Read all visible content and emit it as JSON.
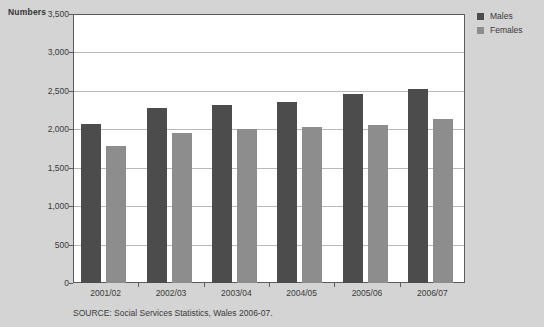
{
  "chart_data": {
    "type": "bar",
    "title": "",
    "xlabel": "",
    "ylabel": "Numbers",
    "ylim": [
      0,
      3500
    ],
    "yticks": [
      0,
      500,
      1000,
      1500,
      2000,
      2500,
      3000,
      3500
    ],
    "ytick_labels": [
      "0",
      "500",
      "1,000",
      "1,500",
      "2,000",
      "2,500",
      "3,000",
      "3,500"
    ],
    "grid": true,
    "legend_position": "top-right",
    "categories": [
      "2001/02",
      "2002/03",
      "2003/04",
      "2004/05",
      "2005/06",
      "2006/07"
    ],
    "series": [
      {
        "name": "Males",
        "color": "#4c4c4c",
        "values": [
          2070,
          2280,
          2320,
          2360,
          2460,
          2530
        ]
      },
      {
        "name": "Females",
        "color": "#8d8d8d",
        "values": [
          1780,
          1950,
          2000,
          2030,
          2060,
          2140
        ]
      }
    ],
    "source": "SOURCE: Social Services Statistics, Wales 2006-07."
  },
  "colors": {
    "page_background": "#d4d4d4",
    "plot_background": "#ffffff",
    "axis": "#5c5c5c",
    "gridline": "#b9b9b9",
    "males": "#4c4c4c",
    "females": "#8d8d8d",
    "text": "#3a3a3a"
  }
}
